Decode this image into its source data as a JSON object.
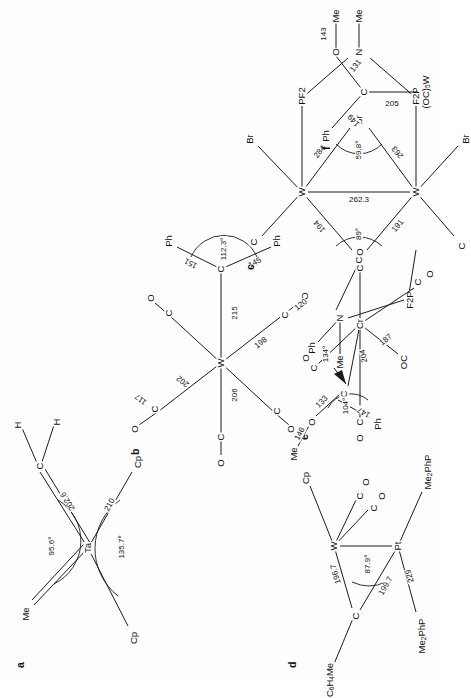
{
  "figure": {
    "page_orientation": "text rotated 90 degrees counter-clockwise",
    "ink_color": "#1b1b1b",
    "paper_color": "#fefefe"
  },
  "structures": [
    {
      "tag": "a",
      "center": "Ta",
      "atoms": [
        "Cp",
        "Cp",
        "Me",
        "C",
        "H",
        "H"
      ],
      "labels": {
        "metal": "Ta",
        "cp1": "Cp",
        "cp2": "Cp",
        "me": "Me",
        "carbene": "C",
        "h1": "H",
        "h2": "H"
      },
      "distances": [
        "210",
        "202.6"
      ],
      "angles": [
        "135.7°",
        "95.6°"
      ]
    },
    {
      "tag": "b",
      "center": "W",
      "labels": {
        "metal": "W",
        "carbene": "C",
        "ph1": "Ph",
        "ph2": "Ph",
        "co1": "C",
        "co1o": "O",
        "co2": "C",
        "co2o": "O",
        "co3": "C",
        "co3o": "O",
        "co4": "C",
        "co4o": "O",
        "co5": "C",
        "co5o": "O"
      },
      "distances": [
        "117",
        "202",
        "206",
        "198",
        "120",
        "215",
        "151",
        "145"
      ],
      "angles": [
        "112.3°"
      ]
    },
    {
      "tag": "c",
      "centers": [
        "W",
        "W"
      ],
      "labels": {
        "metal1": "W",
        "metal2": "W",
        "carbene": "C",
        "br_bridge": "Br",
        "br1": "Br",
        "br2": "Br",
        "co1": "C",
        "co1o": "O",
        "co2": "C",
        "co2o": "O",
        "pf2_a": "PF2",
        "pf2_b": "PF2",
        "f2p_a": "F2P",
        "f2p_b": "F2P",
        "n1": "N",
        "n2": "N",
        "me1": "Me",
        "me2": "Me",
        "ph": "Ph"
      },
      "distances": [
        "194",
        "191",
        "262.3",
        "284",
        "263"
      ],
      "angles": [
        "89°",
        "59.8°"
      ]
    },
    {
      "tag": "d",
      "centers": [
        "W",
        "Pt"
      ],
      "labels": {
        "metal1": "W",
        "metal2": "Pt",
        "carbene": "C",
        "aryl": "C6H4Me",
        "cp": "Cp",
        "co1": "C",
        "co1o": "O",
        "co2": "C",
        "co2o": "O",
        "phos1": "Me2PhP",
        "phos2": "Me2PhP"
      },
      "distances": [
        "196.7",
        "199.7",
        "229"
      ],
      "angles": [
        "87.9°"
      ]
    },
    {
      "tag": "e",
      "center": "Cr",
      "labels": {
        "metal": "Cr",
        "carbene": "C",
        "o": "O",
        "me": "Me",
        "ph": "Ph",
        "co1": "C",
        "co1o": "O",
        "co2": "C",
        "co2o": "O",
        "co3": "C",
        "co3o": "O",
        "co4": "OC",
        "co5": "C",
        "co5o": "O"
      },
      "distances": [
        "204",
        "187",
        "133",
        "146",
        "147"
      ],
      "angles": [
        "104°",
        "134°"
      ]
    },
    {
      "tag": "f",
      "labels": {
        "metal_fragment": "(OC)5W",
        "carbene": "C",
        "ph": "Ph",
        "o": "O",
        "me": "Me"
      },
      "distances": [
        "205",
        "149",
        "131",
        "143"
      ],
      "angles": []
    }
  ]
}
